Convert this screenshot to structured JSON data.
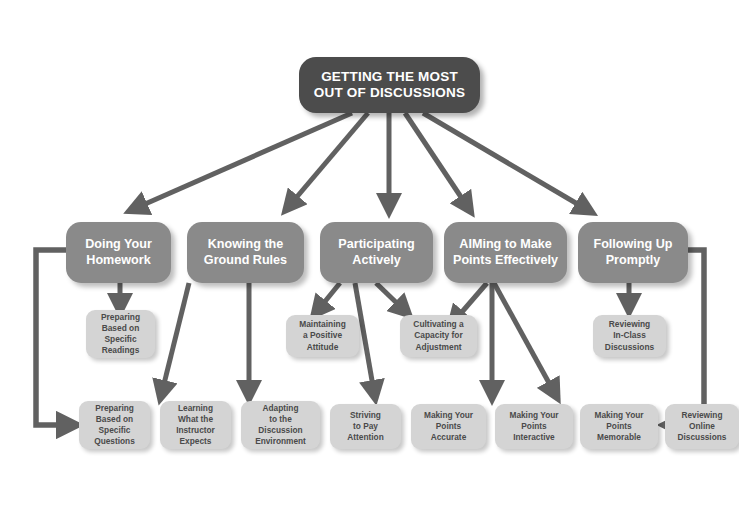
{
  "diagram": {
    "title": "Getting the Most Out of Discussions",
    "type": "hierarchical-flow-chart",
    "colors": {
      "root_fill": "#4c4c4c",
      "root_text": "#ffffff",
      "category_fill": "#8a8a8a",
      "category_text": "#ffffff",
      "leaf_fill": "#d4d4d4",
      "leaf_text": "#4a4a4a",
      "arrow": "#616161",
      "background": "#ffffff"
    }
  },
  "root": {
    "line1": "GETTING THE MOST",
    "line2": "OUT OF DISCUSSIONS"
  },
  "categories": [
    {
      "id": "homework",
      "line1": "Doing Your",
      "line2": "Homework"
    },
    {
      "id": "ground-rules",
      "line1": "Knowing the",
      "line2": "Ground Rules"
    },
    {
      "id": "participating",
      "line1": "Participating",
      "line2": "Actively"
    },
    {
      "id": "aiming",
      "line1": "AIMing to Make",
      "line2": "Points Effectively"
    },
    {
      "id": "following-up",
      "line1": "Following Up",
      "line2": "Promptly"
    }
  ],
  "middle_leaves": [
    {
      "id": "preparing-readings",
      "lines": [
        "Preparing",
        "Based on",
        "Specific",
        "Readings"
      ]
    },
    {
      "id": "positive-attitude",
      "lines": [
        "Maintaining",
        "a Positive",
        "Attitude"
      ]
    },
    {
      "id": "capacity-adjustment",
      "lines": [
        "Cultivating a",
        "Capacity for",
        "Adjustment"
      ]
    },
    {
      "id": "reviewing-in-class",
      "lines": [
        "Reviewing",
        "In-Class",
        "Discussions"
      ]
    }
  ],
  "bottom_leaves": [
    {
      "id": "preparing-questions",
      "lines": [
        "Preparing",
        "Based on",
        "Specific",
        "Questions"
      ]
    },
    {
      "id": "instructor-expects",
      "lines": [
        "Learning",
        "What the",
        "Instructor",
        "Expects"
      ]
    },
    {
      "id": "discussion-env",
      "lines": [
        "Adapting",
        "to the",
        "Discussion",
        "Environment"
      ]
    },
    {
      "id": "pay-attention",
      "lines": [
        "Striving",
        "to Pay",
        "Attention"
      ]
    },
    {
      "id": "points-accurate",
      "lines": [
        "Making Your",
        "Points",
        "Accurate"
      ]
    },
    {
      "id": "points-interactive",
      "lines": [
        "Making Your",
        "Points",
        "Interactive"
      ]
    },
    {
      "id": "points-memorable",
      "lines": [
        "Making Your",
        "Points",
        "Memorable"
      ]
    },
    {
      "id": "reviewing-online",
      "lines": [
        "Reviewing",
        "Online",
        "Discussions"
      ]
    }
  ]
}
